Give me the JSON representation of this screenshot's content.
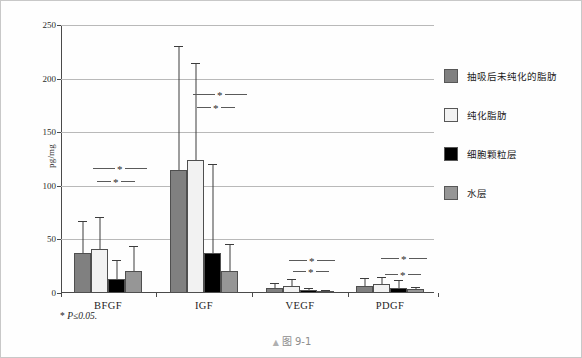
{
  "figure": {
    "caption_marker": "▲",
    "caption": "图 9-1",
    "footnote_star": "*",
    "footnote_text": "P≤0.05."
  },
  "legend": {
    "items": [
      {
        "label": "抽吸后未纯化的脂肪",
        "color": "#808080"
      },
      {
        "label": "纯化脂肪",
        "color": "#f2f2f2"
      },
      {
        "label": "细胞颗粒层",
        "color": "#000000"
      },
      {
        "label": "水层",
        "color": "#969696"
      }
    ]
  },
  "chart_data": {
    "type": "bar",
    "title": "",
    "xlabel": "",
    "ylabel": "pg/mg",
    "ylim": [
      0,
      250
    ],
    "yticks": [
      0,
      50,
      100,
      150,
      200,
      250
    ],
    "ytick_labels": [
      "0",
      "50",
      "100",
      "150",
      "200",
      "250"
    ],
    "grid": true,
    "legend_position": "right",
    "categories": [
      "BFGF",
      "IGF",
      "VEGF",
      "PDGF"
    ],
    "series": [
      {
        "name": "抽吸后未纯化的脂肪",
        "color": "#808080",
        "values": [
          37,
          115,
          5,
          7
        ],
        "err_upper": [
          67,
          230,
          9,
          14
        ]
      },
      {
        "name": "纯化脂肪",
        "color": "#f2f2f2",
        "values": [
          41,
          124,
          7,
          8
        ],
        "err_upper": [
          71,
          215,
          13,
          15
        ]
      },
      {
        "name": "细胞颗粒层",
        "color": "#000000",
        "values": [
          13,
          37,
          3,
          5
        ],
        "err_upper": [
          31,
          120,
          5,
          12
        ]
      },
      {
        "name": "水层",
        "color": "#969696",
        "values": [
          21,
          21,
          2,
          4
        ],
        "err_upper": [
          44,
          46,
          3,
          6
        ]
      }
    ],
    "annotations": [
      {
        "group": "BFGF",
        "label": "*",
        "y": 116
      },
      {
        "group": "BFGF",
        "label": "*",
        "y": 104
      },
      {
        "group": "IGF",
        "label": "*",
        "y": 185
      },
      {
        "group": "IGF",
        "label": "*",
        "y": 173
      },
      {
        "group": "VEGF",
        "label": "*",
        "y": 30
      },
      {
        "group": "VEGF",
        "label": "*",
        "y": 20
      },
      {
        "group": "PDGF",
        "label": "*",
        "y": 32
      },
      {
        "group": "PDGF",
        "label": "*",
        "y": 17
      }
    ]
  }
}
